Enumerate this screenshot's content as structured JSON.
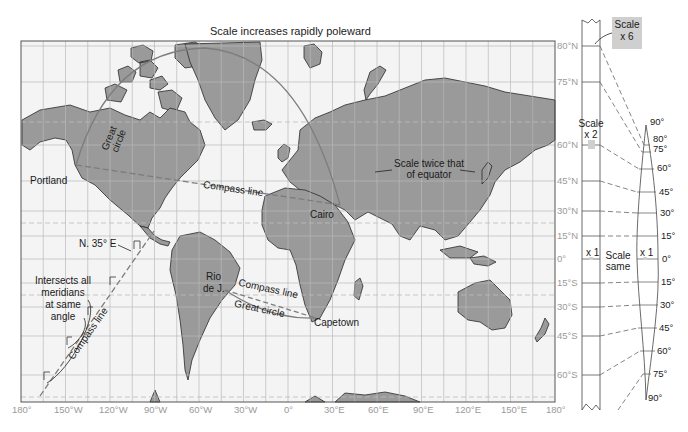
{
  "title": "Scale increases rapidly poleward",
  "colors": {
    "land": "#9a9a9a",
    "ocean": "#f4f4f4",
    "grid": "#b9b9b9",
    "frame": "#555555",
    "axis_label": "#9a9a9a",
    "text": "#1a1a1a",
    "great_circle": "#7d7d7d",
    "compass_line": "#7d7d7d",
    "scale_box": "#cfcfcf"
  },
  "axes": {
    "longitude_labels": [
      "180°",
      "150°W",
      "120°W",
      "90°W",
      "60°W",
      "30°W",
      "0°",
      "30°E",
      "60°E",
      "90°E",
      "120°E",
      "150°E",
      "180°"
    ],
    "latitude_labels": [
      "80°N",
      "75°N",
      "60°N",
      "45°N",
      "30°N",
      "15°N",
      "0°",
      "15°S",
      "30°S",
      "45°S",
      "60°S"
    ]
  },
  "places": {
    "portland": "Portland",
    "cairo": "Cairo",
    "rio_line1": "Rio",
    "rio_line2": "de J.",
    "capetown": "Capetown"
  },
  "annotations": {
    "great_circle_north_1": "Great",
    "great_circle_north_2": "circle",
    "compass_line_north": "Compass line",
    "scale_twice_1": "Scale twice that",
    "scale_twice_2": "of equator",
    "bearing": "N. 35° E",
    "intersects_1": "Intersects all",
    "intersects_2": "meridians",
    "intersects_3": "at same",
    "intersects_4": "angle",
    "compass_line_west": "Compass line",
    "compass_line_south": "Compass line",
    "great_circle_south": "Great circle"
  },
  "scale_panel": {
    "scale_x6_1": "Scale",
    "scale_x6_2": "x 6",
    "scale_x2_1": "Scale",
    "scale_x2_2": "x 2",
    "x1_left": "x 1",
    "x1_right": "x 1",
    "scale_same_1": "Scale",
    "scale_same_2": "same",
    "globe_labels": [
      "90°",
      "80°",
      "75°",
      "60°",
      "45°",
      "30°",
      "15°",
      "0°",
      "15°",
      "30°",
      "45°",
      "60°",
      "75°",
      "90°"
    ]
  }
}
